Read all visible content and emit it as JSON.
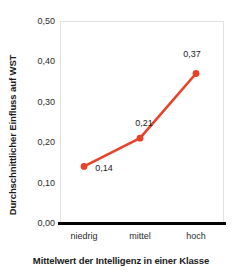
{
  "chart_data": {
    "type": "line",
    "title": "",
    "xlabel": "Mittelwert der Intelligenz in einer Klasse",
    "ylabel": "Durchschnittlicher Einfluss auf WST",
    "categories": [
      "niedrig",
      "mittel",
      "hoch"
    ],
    "values": [
      0.14,
      0.21,
      0.37
    ],
    "point_labels": [
      "0,14",
      "0,21",
      "0,37"
    ],
    "ylim": [
      0.0,
      0.5
    ],
    "ytick_values": [
      0.5,
      0.4,
      0.3,
      0.2,
      0.1,
      0.0
    ],
    "ytick_labels": [
      "0,50",
      "0,40",
      "0,30",
      "0,20",
      "0,10",
      "0,00"
    ],
    "grid": false,
    "legend": null,
    "series_color": "#E8412A",
    "marker": "circle",
    "decimal_separator": ","
  },
  "axes": {
    "y_title": "Durchschnittlicher Einfluss auf WST",
    "x_title": "Mittelwert der Intelligenz in einer Klasse"
  },
  "colors": {
    "line": "#E8412A",
    "marker": "#E8412A",
    "axis": "#000000",
    "frame": "#e2e2e2",
    "text": "#1a1a1a",
    "background": "#ffffff"
  }
}
